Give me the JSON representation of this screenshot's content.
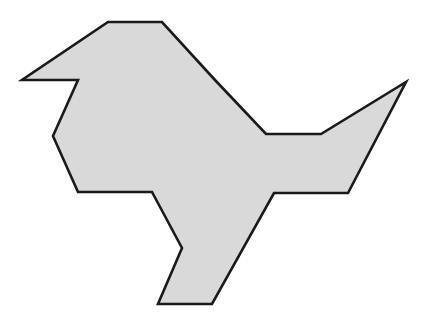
{
  "figure": {
    "fill_color": "#d9d9d9",
    "stroke_color": "#1a1a1a",
    "stroke_width": 2.6,
    "background": "#ffffff",
    "points": "108,22 162,22 215,80 266,134 321,134 406,82 348,193 274,193 212,304 158,304 182,248 152,192 78,192 53,136 78,80 22,80"
  }
}
